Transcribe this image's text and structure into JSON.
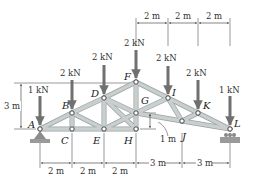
{
  "diagram": {
    "colors": {
      "member": "#c9cfcf",
      "member_edge": "#9aa2a2",
      "load_arrow": "#707070",
      "dim_line": "#333333",
      "support": "#8c8c8c",
      "node": "#ffffff"
    },
    "nodes": [
      {
        "id": "A",
        "label": "A",
        "x": 40,
        "y": 129,
        "lx": 28,
        "ly": 128
      },
      {
        "id": "B",
        "label": "B",
        "x": 72,
        "y": 113,
        "lx": 62,
        "ly": 109
      },
      {
        "id": "C",
        "label": "C",
        "x": 72,
        "y": 129,
        "lx": 61,
        "ly": 144
      },
      {
        "id": "D",
        "label": "D",
        "x": 104,
        "y": 98,
        "lx": 91,
        "ly": 97
      },
      {
        "id": "E",
        "label": "E",
        "x": 104,
        "y": 129,
        "lx": 93,
        "ly": 144
      },
      {
        "id": "F",
        "label": "F",
        "x": 136,
        "y": 82,
        "lx": 124,
        "ly": 80
      },
      {
        "id": "G",
        "label": "G",
        "x": 136,
        "y": 113,
        "lx": 141,
        "ly": 104
      },
      {
        "id": "H",
        "label": "H",
        "x": 136,
        "y": 129,
        "lx": 124,
        "ly": 144
      },
      {
        "id": "I",
        "label": "I",
        "x": 168,
        "y": 98,
        "lx": 172,
        "ly": 96
      },
      {
        "id": "J",
        "label": "J",
        "x": 182,
        "y": 121,
        "lx": 182,
        "ly": 140
      },
      {
        "id": "K",
        "label": "K",
        "x": 198,
        "y": 113,
        "lx": 203,
        "ly": 109
      },
      {
        "id": "L",
        "label": "L",
        "x": 230,
        "y": 129,
        "lx": 234,
        "ly": 127
      }
    ],
    "members": [
      [
        "A",
        "B"
      ],
      [
        "B",
        "D"
      ],
      [
        "D",
        "F"
      ],
      [
        "F",
        "I"
      ],
      [
        "I",
        "K"
      ],
      [
        "K",
        "L"
      ],
      [
        "A",
        "C"
      ],
      [
        "C",
        "E"
      ],
      [
        "E",
        "H"
      ],
      [
        "H",
        "G"
      ],
      [
        "G",
        "J"
      ],
      [
        "J",
        "L"
      ],
      [
        "B",
        "C"
      ],
      [
        "B",
        "E"
      ],
      [
        "D",
        "E"
      ],
      [
        "D",
        "G"
      ],
      [
        "E",
        "G"
      ],
      [
        "G",
        "F"
      ],
      [
        "G",
        "I"
      ],
      [
        "I",
        "J"
      ],
      [
        "J",
        "K"
      ],
      [
        "D",
        "H"
      ]
    ],
    "loads": [
      {
        "node": "A",
        "label": "1 kN",
        "x": 40,
        "top": 96,
        "tip": 125,
        "lx": 28,
        "ly": 93
      },
      {
        "node": "B",
        "label": "2 kN",
        "x": 72,
        "top": 80,
        "tip": 109,
        "lx": 60,
        "ly": 76
      },
      {
        "node": "D",
        "label": "2 kN",
        "x": 104,
        "top": 65,
        "tip": 94,
        "lx": 92,
        "ly": 60
      },
      {
        "node": "F",
        "label": "2 kN",
        "x": 136,
        "top": 50,
        "tip": 78,
        "lx": 124,
        "ly": 46
      },
      {
        "node": "I",
        "label": "2 kN",
        "x": 168,
        "top": 66,
        "tip": 94,
        "lx": 156,
        "ly": 61
      },
      {
        "node": "K",
        "label": "2 kN",
        "x": 198,
        "top": 80,
        "tip": 109,
        "lx": 186,
        "ly": 76
      },
      {
        "node": "L",
        "label": "1 kN",
        "x": 230,
        "top": 96,
        "tip": 125,
        "lx": 219,
        "ly": 93
      }
    ],
    "dimensions": {
      "top": [
        {
          "label": "2 m",
          "x1": 136,
          "x2": 168,
          "y": 23,
          "lx": 144,
          "ly": 19
        },
        {
          "label": "2 m",
          "x1": 168,
          "x2": 198,
          "y": 23,
          "lx": 175,
          "ly": 19
        },
        {
          "label": "2 m",
          "x1": 198,
          "x2": 230,
          "y": 23,
          "lx": 206,
          "ly": 19
        }
      ],
      "bottom": [
        {
          "label": "2 m",
          "x1": 40,
          "x2": 72,
          "y": 163,
          "lx": 48,
          "ly": 174
        },
        {
          "label": "2 m",
          "x1": 72,
          "x2": 104,
          "y": 163,
          "lx": 80,
          "ly": 174
        },
        {
          "label": "2 m",
          "x1": 104,
          "x2": 136,
          "y": 163,
          "lx": 112,
          "ly": 174
        },
        {
          "label": "3 m",
          "x1": 136,
          "x2": 182,
          "y": 163,
          "lx": 150,
          "ly": 166
        },
        {
          "label": "3 m",
          "x1": 182,
          "x2": 230,
          "y": 163,
          "lx": 197,
          "ly": 166
        }
      ],
      "height": {
        "label": "3 m",
        "x": 21,
        "y1": 83,
        "y2": 129,
        "lx": 4,
        "ly": 109
      },
      "offset": {
        "label": "1 m",
        "x": 150,
        "y1": 113,
        "y2": 129,
        "lx": 160,
        "ly": 142
      }
    },
    "supports": [
      {
        "node": "A",
        "type": "pin",
        "x": 40,
        "y": 129
      },
      {
        "node": "L",
        "type": "roller",
        "x": 230,
        "y": 129
      }
    ]
  }
}
